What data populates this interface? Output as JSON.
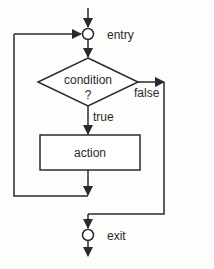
{
  "diagram": {
    "type": "flowchart",
    "nodes": {
      "entry": {
        "label": "entry"
      },
      "condition": {
        "line1": "condition",
        "line2": "?"
      },
      "action": {
        "label": "action"
      },
      "exit": {
        "label": "exit"
      }
    },
    "edges": {
      "true_label": "true",
      "false_label": "false"
    },
    "colors": {
      "stroke": "#2a2a2a",
      "background": "#fdfdfb"
    }
  }
}
